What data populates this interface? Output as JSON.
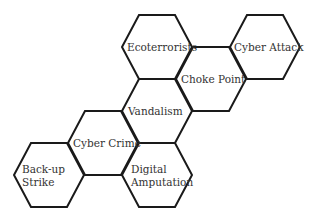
{
  "diagram": {
    "type": "hexagon-cluster",
    "hexagons": [
      {
        "id": "ecoterrorists",
        "lines": [
          "Ecoterrorists"
        ],
        "cx": 157,
        "cy": 47,
        "label_x": 127,
        "label_y": 41
      },
      {
        "id": "cyber-attack",
        "lines": [
          "Cyber Attack"
        ],
        "cx": 265,
        "cy": 47,
        "label_x": 234,
        "label_y": 41
      },
      {
        "id": "choke-point",
        "lines": [
          "Choke Point"
        ],
        "cx": 211,
        "cy": 79,
        "label_x": 181,
        "label_y": 73
      },
      {
        "id": "vandalism",
        "lines": [
          "Vandalism"
        ],
        "cx": 157,
        "cy": 111,
        "label_x": 128,
        "label_y": 105
      },
      {
        "id": "cyber-crime",
        "lines": [
          "Cyber Crime"
        ],
        "cx": 103,
        "cy": 143,
        "label_x": 73,
        "label_y": 137
      },
      {
        "id": "back-up-strike",
        "lines": [
          "Back-up",
          "Strike"
        ],
        "cx": 49,
        "cy": 175,
        "label_x": 22,
        "label_y": 163
      },
      {
        "id": "digital-amputation",
        "lines": [
          "Digital",
          "Amputation"
        ],
        "cx": 157,
        "cy": 175,
        "label_x": 131,
        "label_y": 163
      }
    ],
    "connectors": [
      {
        "from": "ecoterrorists",
        "to": "cyber-attack",
        "x1": 192,
        "y1": 47,
        "x2": 230,
        "y2": 47
      },
      {
        "from": "back-up-strike",
        "to": "digital-amputation",
        "x1": 84,
        "y1": 175,
        "x2": 122,
        "y2": 175
      }
    ],
    "colors": {
      "stroke": "#1a1a1a",
      "text": "#333333",
      "background": "#ffffff"
    }
  }
}
